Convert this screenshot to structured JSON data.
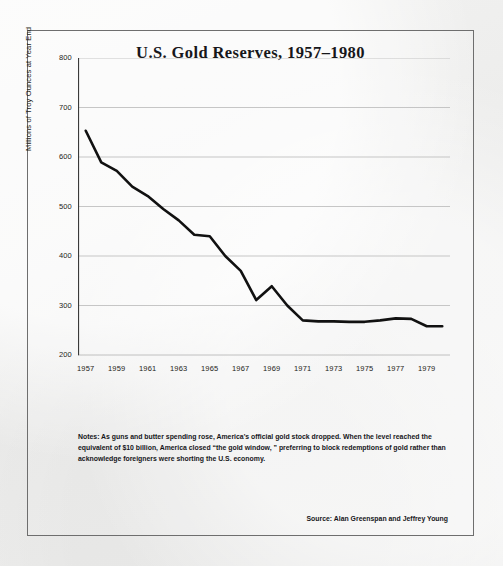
{
  "figure": {
    "title": "U.S. Gold Reserves, 1957–1980",
    "notes_label": "Notes:",
    "notes_lines": [
      "Notes:  As guns and butter spending rose, America's official gold stock dropped. When the level reached the",
      "equivalent of $10 billion, America closed “the gold window, ”  preferring to block redemptions of gold rather than",
      "acknowledge foreigners were shorting the U.S. economy."
    ],
    "source": "Source: Alan Greenspan and Jeffrey Young",
    "frame_color": "#6e6e6e",
    "background_color": "#f0f0ef",
    "line_color": "#111111",
    "grid_color": "#b9b9b9"
  },
  "chart_data": {
    "type": "line",
    "title": "U.S. Gold Reserves, 1957–1980",
    "xlabel": "",
    "ylabel": "Millions of Troy Ounces at Year End",
    "xlim": [
      1956.5,
      1980.5
    ],
    "ylim": [
      200,
      800
    ],
    "ytick_values": [
      200,
      300,
      400,
      500,
      600,
      700,
      800
    ],
    "ytick_labels": [
      "200",
      "300",
      "400",
      "500",
      "600",
      "700",
      "800"
    ],
    "xtick_values": [
      1957,
      1959,
      1961,
      1963,
      1965,
      1967,
      1969,
      1971,
      1973,
      1975,
      1977,
      1979
    ],
    "xtick_labels": [
      "1957",
      "1959",
      "1961",
      "1963",
      "1965",
      "1967",
      "1969",
      "1971",
      "1973",
      "1975",
      "1977",
      "1979"
    ],
    "grid": "horizontal",
    "legend": "none",
    "series": [
      {
        "name": "U.S. Gold Reserves",
        "x": [
          1957,
          1958,
          1959,
          1960,
          1961,
          1962,
          1963,
          1964,
          1965,
          1966,
          1967,
          1968,
          1969,
          1970,
          1971,
          1972,
          1973,
          1974,
          1975,
          1976,
          1977,
          1978,
          1979,
          1980
        ],
        "values": [
          653,
          589,
          572,
          540,
          521,
          495,
          472,
          443,
          440,
          400,
          370,
          311,
          339,
          300,
          270,
          268,
          268,
          267,
          267,
          270,
          274,
          273,
          258,
          258
        ]
      }
    ]
  }
}
